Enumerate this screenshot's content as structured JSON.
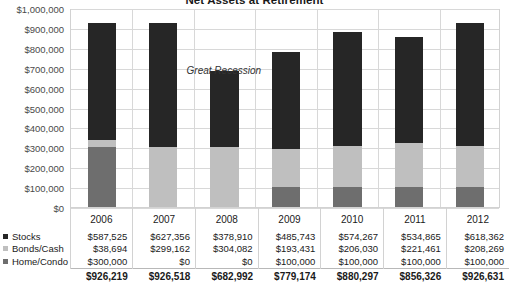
{
  "chart_data": {
    "type": "bar",
    "stacked": true,
    "title": "Net Assets at Retirement",
    "xlabel": "",
    "ylabel": "",
    "ylim": [
      0,
      1000000
    ],
    "ytick_step": 100000,
    "grid": true,
    "legend_position": "table-left",
    "categories": [
      "2006",
      "2007",
      "2008",
      "2009",
      "2010",
      "2011",
      "2012"
    ],
    "ytick_labels": [
      "$1,000,000",
      "$900,000",
      "$800,000",
      "$700,000",
      "$600,000",
      "$500,000",
      "$400,000",
      "$300,000",
      "$200,000",
      "$100,000",
      "$0"
    ],
    "ytick_values": [
      1000000,
      900000,
      800000,
      700000,
      600000,
      500000,
      400000,
      300000,
      200000,
      100000,
      0
    ],
    "series": [
      {
        "name": "Stocks",
        "color": "#262626",
        "values": [
          587525,
          627356,
          378910,
          485743,
          574267,
          534865,
          618362
        ],
        "labels": [
          "$587,525",
          "$627,356",
          "$378,910",
          "$485,743",
          "$574,267",
          "$534,865",
          "$618,362"
        ]
      },
      {
        "name": "Bonds/Cash",
        "color": "#bfbfbf",
        "values": [
          38694,
          299162,
          304082,
          193431,
          206030,
          221461,
          208269
        ],
        "labels": [
          "$38,694",
          "$299,162",
          "$304,082",
          "$193,431",
          "$206,030",
          "$221,461",
          "$208,269"
        ]
      },
      {
        "name": "Home/Condo",
        "color": "#6e6e6e",
        "values": [
          300000,
          0,
          0,
          100000,
          100000,
          100000,
          100000
        ],
        "labels": [
          "$300,000",
          "$0",
          "$0",
          "$100,000",
          "$100,000",
          "$100,000",
          "$100,000"
        ]
      }
    ],
    "totals": {
      "values": [
        926219,
        926518,
        682992,
        779174,
        880297,
        856326,
        926631
      ],
      "labels": [
        "$926,219",
        "$926,518",
        "$682,992",
        "$779,174",
        "$880,297",
        "$856,326",
        "$926,631"
      ]
    },
    "annotations": [
      {
        "text": "Great Recession",
        "x_category": "2008",
        "y_value": 720000
      }
    ]
  },
  "colors": {
    "stocks": "#262626",
    "bonds_cash": "#bfbfbf",
    "home_condo": "#6e6e6e",
    "gridline": "#d8d8d8",
    "axis_text": "#4a4a4a",
    "text": "#1a1a1a"
  }
}
